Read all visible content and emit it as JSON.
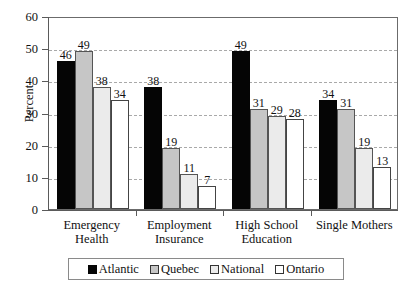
{
  "chart_data": {
    "type": "bar",
    "title": "",
    "subtitle": "",
    "xlabel": "",
    "ylabel": "Percent",
    "ylim": [
      0,
      60
    ],
    "ytick_values": [
      0,
      10,
      20,
      30,
      40,
      50,
      60
    ],
    "ytick_labels": [
      "0",
      "10",
      "20",
      "30",
      "40",
      "50",
      "60"
    ],
    "grid": true,
    "grid_axis": "y",
    "grid_style": "dashed",
    "legend_position": "bottom",
    "categories": [
      "Emergency Health",
      "Employment Insurance",
      "High School Education",
      "Single Mothers"
    ],
    "category_lines": [
      [
        "Emergency",
        "Health"
      ],
      [
        "Employment",
        "Insurance"
      ],
      [
        "High School",
        "Education"
      ],
      [
        "Single Mothers",
        ""
      ]
    ],
    "series": [
      {
        "name": "Atlantic",
        "color": "#050505",
        "values": [
          46,
          38,
          49,
          34
        ]
      },
      {
        "name": "Quebec",
        "color": "#c6c6c6",
        "values": [
          49,
          19,
          31,
          31
        ]
      },
      {
        "name": "National",
        "color": "#ebebeb",
        "values": [
          38,
          11,
          29,
          19
        ]
      },
      {
        "name": "Ontario",
        "color": "#ffffff",
        "values": [
          34,
          7,
          28,
          13
        ]
      }
    ],
    "value_labels_shown": true
  },
  "legend": {
    "items": [
      {
        "label": "Atlantic"
      },
      {
        "label": "Quebec"
      },
      {
        "label": "National"
      },
      {
        "label": "Ontario"
      }
    ]
  },
  "colors": {
    "axis": "#5a5a5a",
    "grid": "#a9a9a9",
    "text": "#111111",
    "frame": "#6b6b6b",
    "background": "#ffffff"
  }
}
